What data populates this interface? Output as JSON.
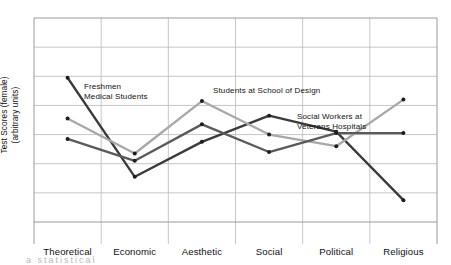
{
  "chart_data": {
    "type": "line",
    "title": "",
    "xlabel": "",
    "ylabel": "Test Scores (female)\n(arbitrary units)",
    "ylabel_line1": "Test Scores (female)",
    "ylabel_line2": "(arbitrary units)",
    "categories": [
      "Theoretical",
      "Economic",
      "Aesthetic",
      "Social",
      "Political",
      "Religious"
    ],
    "ylim": [
      0,
      7
    ],
    "grid": true,
    "gridlines_horizontal": 7,
    "legend_position": "inline-annotations",
    "axis_ticks_shown": false,
    "series": [
      {
        "name": "Freshmen Medical Students",
        "color": "#3a3a3a",
        "values": [
          4.95,
          1.55,
          2.75,
          3.65,
          3.1,
          0.75
        ]
      },
      {
        "name": "Students at School of Design",
        "color": "#a8a8a8",
        "values": [
          3.55,
          2.35,
          4.15,
          3.0,
          2.6,
          4.2
        ]
      },
      {
        "name": "Social Workers at Veterans Hospitals",
        "color": "#5a5a5a",
        "values": [
          2.85,
          2.1,
          3.35,
          2.4,
          3.05,
          3.05
        ]
      }
    ],
    "annotations": [
      {
        "name": "Freshmen Medical Students",
        "line1": "Freshmen",
        "line2": "Medical Students",
        "x": 84,
        "y": 82
      },
      {
        "name": "Students at School of Design",
        "line1": "Students at School of Design",
        "line2": "",
        "x": 213,
        "y": 86
      },
      {
        "name": "Social Workers at Veterans Hospitals",
        "line1": "Social Workers at",
        "line2": "Veterans Hospitals",
        "x": 297,
        "y": 112
      }
    ]
  },
  "plot": {
    "left": 34,
    "right": 437,
    "top": 18,
    "bottom": 222,
    "frame_color": "#9a9a9a",
    "grid_color": "#bfbfbf"
  },
  "footer_artifact": "a statistical"
}
